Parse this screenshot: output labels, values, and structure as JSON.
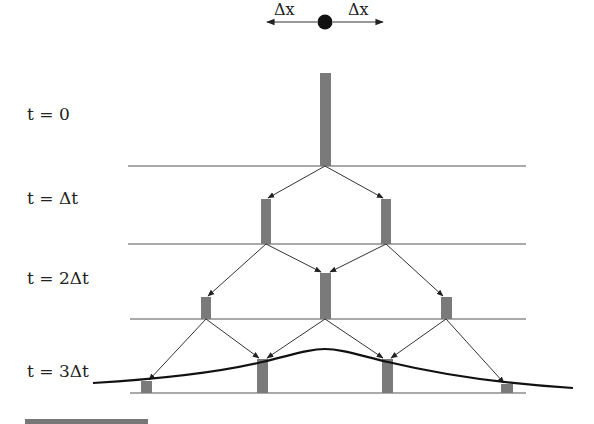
{
  "diagram": {
    "step_labels": {
      "dx_left": "Δx",
      "dx_right": "Δx"
    },
    "time_labels": [
      {
        "id": "t0",
        "text": "t = 0"
      },
      {
        "id": "t1",
        "text": "t = Δt"
      },
      {
        "id": "t2",
        "text": "t = 2Δt"
      },
      {
        "id": "t3",
        "text": "t = 3Δt"
      }
    ],
    "rows": [
      {
        "time": "t = 0",
        "bars": [
          {
            "x": 325,
            "height": 93
          }
        ]
      },
      {
        "time": "t = Δt",
        "bars": [
          {
            "x": 266,
            "height": 45
          },
          {
            "x": 386,
            "height": 45
          }
        ]
      },
      {
        "time": "t = 2Δt",
        "bars": [
          {
            "x": 206,
            "height": 22
          },
          {
            "x": 325,
            "height": 46
          },
          {
            "x": 446,
            "height": 22
          }
        ]
      },
      {
        "time": "t = 3Δt",
        "bars": [
          {
            "x": 146,
            "height": 12
          },
          {
            "x": 262,
            "height": 34
          },
          {
            "x": 387,
            "height": 34
          },
          {
            "x": 507,
            "height": 9
          }
        ]
      }
    ],
    "colors": {
      "bar": "#7a7a7a",
      "line": "#555555",
      "curve": "#111111",
      "dot": "#111111"
    }
  }
}
